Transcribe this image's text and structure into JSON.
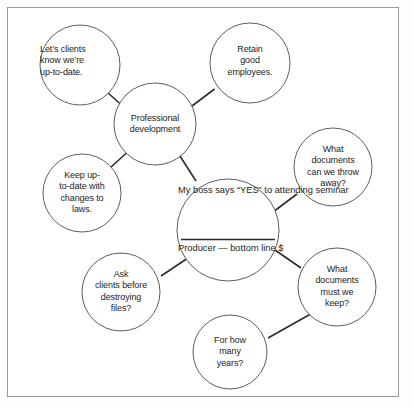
{
  "diagram": {
    "frame_color": "#9a9a9a",
    "circle_stroke": "#5d5d5d",
    "connector_color": "#2b2b2b",
    "text_color": "#242424",
    "background": "#ffffff"
  },
  "nodes": {
    "center": {
      "name": "my-boss-says-yes",
      "top_lines": [
        "My boss",
        "says “YES”",
        "to attending",
        "seminar"
      ],
      "bottom_lines": [
        "Producer —",
        "bottom line",
        "$"
      ]
    },
    "professional_development": {
      "name": "professional-development",
      "lines": [
        "Professional",
        "development"
      ]
    },
    "lets_clients_know": {
      "name": "lets-clients-know",
      "lines": [
        "Let’s clients",
        "know we’re",
        "up-to-date."
      ]
    },
    "retain_good_employees": {
      "name": "retain-good-employees",
      "lines": [
        "Retain",
        "good",
        "employees."
      ]
    },
    "keep_up_to_date": {
      "name": "keep-up-to-date-with-changes-to-laws",
      "lines": [
        "Keep up-",
        "to-date with",
        "changes to",
        "laws."
      ]
    },
    "what_documents_throw_away": {
      "name": "what-documents-can-we-throw-away",
      "lines": [
        "What",
        "documents",
        "can we throw",
        "away?"
      ]
    },
    "what_documents_keep": {
      "name": "what-documents-must-we-keep",
      "lines": [
        "What",
        "documents",
        "must we",
        "keep?"
      ]
    },
    "ask_clients_before_destroying": {
      "name": "ask-clients-before-destroying-files",
      "lines": [
        "Ask",
        "clients before",
        "destroying",
        "files?"
      ]
    },
    "for_how_many_years": {
      "name": "for-how-many-years",
      "lines": [
        "For how",
        "many",
        "years?"
      ]
    }
  },
  "connections": [
    {
      "from": "professional_development",
      "to": "lets_clients_know"
    },
    {
      "from": "professional_development",
      "to": "retain_good_employees"
    },
    {
      "from": "professional_development",
      "to": "keep_up_to_date"
    },
    {
      "from": "professional_development",
      "to": "center"
    },
    {
      "from": "center",
      "to": "what_documents_throw_away"
    },
    {
      "from": "center",
      "to": "what_documents_keep"
    },
    {
      "from": "center",
      "to": "ask_clients_before_destroying"
    },
    {
      "from": "what_documents_keep",
      "to": "for_how_many_years"
    }
  ]
}
